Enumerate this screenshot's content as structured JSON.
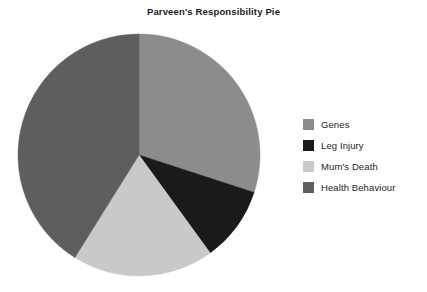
{
  "chart_data": {
    "type": "pie",
    "title": "Parveen's Responsibility Pie",
    "xlabel": "",
    "ylabel": "",
    "legend_position": "right",
    "grid": false,
    "start_angle_deg": 0,
    "direction": "clockwise",
    "categories": [
      "Genes",
      "Leg Injury",
      "Mum's Death",
      "Health Behaviour"
    ],
    "values": [
      30,
      10,
      19,
      41
    ],
    "units": "percent",
    "colors": [
      "#8c8c8c",
      "#1a1a1a",
      "#c9c9c9",
      "#5e5e5e"
    ],
    "slices": [
      {
        "label": "Genes",
        "value": 30,
        "color": "#8c8c8c",
        "start_deg": 0,
        "end_deg": 108
      },
      {
        "label": "Leg Injury",
        "value": 10,
        "color": "#1a1a1a",
        "start_deg": 108,
        "end_deg": 144
      },
      {
        "label": "Mum's Death",
        "value": 19,
        "color": "#c9c9c9",
        "start_deg": 144,
        "end_deg": 212
      },
      {
        "label": "Health Behaviour",
        "value": 41,
        "color": "#5e5e5e",
        "start_deg": 212,
        "end_deg": 360
      }
    ]
  },
  "title": {
    "text": "Parveen's Responsibility Pie"
  },
  "legend": {
    "items": [
      {
        "label": "Genes",
        "color": "#8c8c8c"
      },
      {
        "label": "Leg Injury",
        "color": "#1a1a1a"
      },
      {
        "label": "Mum's Death",
        "color": "#c9c9c9"
      },
      {
        "label": "Health Behaviour",
        "color": "#5e5e5e"
      }
    ]
  },
  "pie": {
    "center_x": 139,
    "center_y": 135,
    "radius": 121
  }
}
